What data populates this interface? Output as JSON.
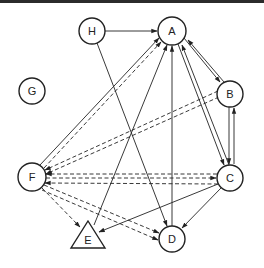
{
  "diagram": {
    "type": "directed-graph",
    "nodes": [
      {
        "id": "H",
        "label": "H",
        "shape": "circle",
        "x": 92,
        "y": 31
      },
      {
        "id": "A",
        "label": "A",
        "shape": "circle",
        "x": 172,
        "y": 31
      },
      {
        "id": "G",
        "label": "G",
        "shape": "circle",
        "x": 32,
        "y": 91
      },
      {
        "id": "B",
        "label": "B",
        "shape": "circle",
        "x": 230,
        "y": 94
      },
      {
        "id": "F",
        "label": "F",
        "shape": "circle",
        "x": 32,
        "y": 177
      },
      {
        "id": "C",
        "label": "C",
        "shape": "circle",
        "x": 230,
        "y": 178
      },
      {
        "id": "E",
        "label": "E",
        "shape": "triangle",
        "x": 88,
        "y": 238
      },
      {
        "id": "D",
        "label": "D",
        "shape": "circle",
        "x": 172,
        "y": 239
      }
    ],
    "edges": [
      {
        "from": "H",
        "to": "A",
        "style": "solid"
      },
      {
        "from": "H",
        "to": "D",
        "style": "solid"
      },
      {
        "from": "A",
        "to": "B",
        "style": "solid"
      },
      {
        "from": "B",
        "to": "A",
        "style": "solid"
      },
      {
        "from": "A",
        "to": "C",
        "style": "solid"
      },
      {
        "from": "C",
        "to": "A",
        "style": "solid"
      },
      {
        "from": "B",
        "to": "C",
        "style": "solid"
      },
      {
        "from": "C",
        "to": "B",
        "style": "solid"
      },
      {
        "from": "D",
        "to": "A",
        "style": "solid"
      },
      {
        "from": "E",
        "to": "A",
        "style": "solid"
      },
      {
        "from": "F",
        "to": "A",
        "style": "solid"
      },
      {
        "from": "F",
        "to": "A",
        "style": "dashed"
      },
      {
        "from": "B",
        "to": "F",
        "style": "dashed"
      },
      {
        "from": "B",
        "to": "F",
        "style": "dashed"
      },
      {
        "from": "C",
        "to": "F",
        "style": "dashed"
      },
      {
        "from": "F",
        "to": "C",
        "style": "dashed"
      },
      {
        "from": "C",
        "to": "F",
        "style": "dashed"
      },
      {
        "from": "F",
        "to": "E",
        "style": "dashed"
      },
      {
        "from": "F",
        "to": "D",
        "style": "dashed"
      },
      {
        "from": "F",
        "to": "D",
        "style": "dashed"
      },
      {
        "from": "C",
        "to": "E",
        "style": "solid"
      },
      {
        "from": "C",
        "to": "D",
        "style": "solid"
      }
    ]
  },
  "labels": {
    "H": "H",
    "A": "A",
    "G": "G",
    "B": "B",
    "F": "F",
    "C": "C",
    "E": "E",
    "D": "D"
  }
}
